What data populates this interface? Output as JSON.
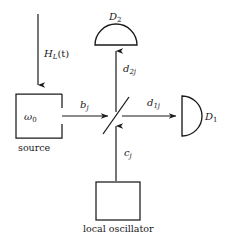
{
  "figure": {
    "kind": "optics-homodyne-detection-schematic",
    "background_color": "#ffffff",
    "stroke_color": "#1a1a1a",
    "text_color": "#1a1a1a"
  },
  "labels": {
    "drive_field": {
      "base": "H",
      "sub": "L",
      "arg": "(t)"
    },
    "source_frequency": {
      "base": "ω",
      "sub": "0"
    },
    "source_caption": "source",
    "local_oscillator_caption": "local oscillator",
    "mode_b": {
      "base": "b",
      "sub": "j"
    },
    "mode_c": {
      "base": "c",
      "sub": "j"
    },
    "mode_d1": {
      "base": "d",
      "sub": "1j"
    },
    "mode_d2": {
      "base": "d",
      "sub": "2j"
    },
    "detector_1": {
      "base": "D",
      "sub": "1"
    },
    "detector_2": {
      "base": "D",
      "sub": "2"
    }
  },
  "components": {
    "source_box": {
      "x": 16,
      "y": 94,
      "w": 46,
      "h": 44
    },
    "local_oscillator_box": {
      "x": 96,
      "y": 182,
      "w": 44,
      "h": 38
    },
    "beam_splitter": {
      "x1": 103,
      "y1": 134,
      "x2": 129,
      "y2": 97
    },
    "detector_1_shape": "half-disc-facing-right",
    "detector_2_shape": "dome-semicircle-flat-bottom"
  },
  "arrows": {
    "drive_field_arrow": {
      "x": 38,
      "y_start": 14,
      "y_end": 89,
      "direction": "down"
    },
    "b_arrow": {
      "y": 116,
      "x_start": 62,
      "x_end": 113,
      "direction": "right"
    },
    "d1_arrow": {
      "y": 116,
      "x_start": 122,
      "x_end": 181,
      "direction": "right"
    },
    "d2_arrow": {
      "x": 116,
      "y_start": 112,
      "y_end": 46,
      "direction": "up"
    },
    "c_arrow": {
      "x": 116,
      "y_start": 181,
      "y_end": 121,
      "direction": "up"
    }
  }
}
